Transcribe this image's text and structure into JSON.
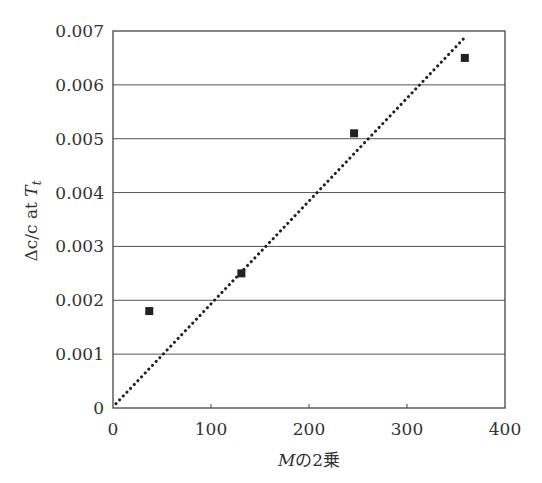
{
  "chart_data": {
    "type": "scatter",
    "title": "",
    "xlabel": "Mの2乗",
    "xlabel_parts": {
      "var": "M",
      "rest": "の2乗"
    },
    "ylabel": "Δc/c at T_t",
    "ylabel_parts": {
      "main": "Δc/c at ",
      "var": "T",
      "sub": "t"
    },
    "xlim": [
      0,
      400
    ],
    "ylim": [
      0,
      0.007
    ],
    "x_ticks": [
      "0",
      "100",
      "200",
      "300",
      "400"
    ],
    "y_ticks": [
      "0",
      "0.001",
      "0.002",
      "0.003",
      "0.004",
      "0.005",
      "0.006",
      "0.007"
    ],
    "grid": {
      "horizontal": true,
      "vertical": false
    },
    "legend": null,
    "series": [
      {
        "name": "measured",
        "marker": "square",
        "color": "#222222",
        "x": [
          37,
          131,
          246,
          359
        ],
        "y": [
          0.0018,
          0.0025,
          0.0051,
          0.0065
        ]
      }
    ],
    "trendline": {
      "style": "dotted",
      "color": "#222222",
      "x": [
        3,
        360
      ],
      "y": [
        8e-05,
        0.0069
      ]
    }
  }
}
